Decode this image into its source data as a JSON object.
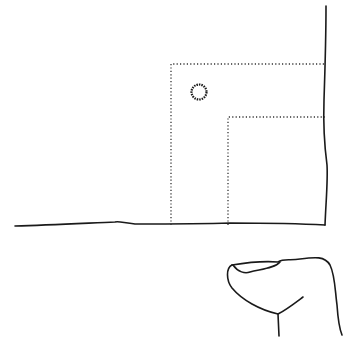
{
  "illustration": {
    "description": "Hand-drawn line sketch: corner of wall and floor with two nested dotted rectangles, a small circle, and a partial figure outline at bottom right",
    "colors": {
      "background": "#ffffff",
      "ink": "#1a1a1a",
      "dotted": "#333333"
    },
    "elements": [
      "floor-line",
      "wall-line",
      "outer-dotted-rectangle",
      "inner-dotted-rectangle",
      "small-circle",
      "figure-outline"
    ]
  }
}
